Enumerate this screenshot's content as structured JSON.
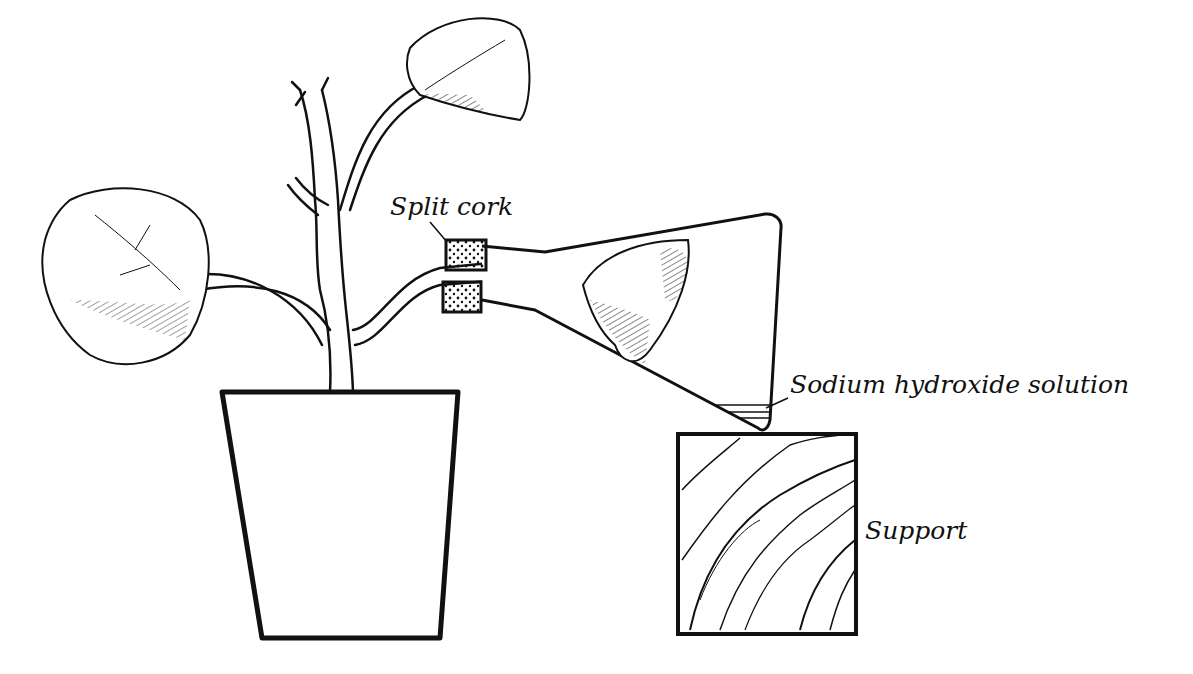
{
  "diagram": {
    "colors": {
      "ink": "#111111",
      "background": "#ffffff"
    },
    "labels": {
      "split_cork": "Split cork",
      "sodium_hydroxide": "Sodium hydroxide solution",
      "support": "Support"
    },
    "components": [
      "potted-plant",
      "plant-pot",
      "leaf-left",
      "leaf-top",
      "leaf-in-flask",
      "split-cork",
      "conical-flask",
      "sodium-hydroxide-solution",
      "wooden-support"
    ]
  }
}
